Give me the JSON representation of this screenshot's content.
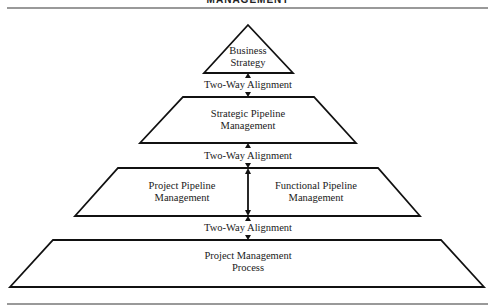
{
  "header": {
    "cut_off_title": "MANAGEMENT"
  },
  "levels": [
    {
      "id": "business-strategy",
      "line1": "Business",
      "line2": "Strategy"
    },
    {
      "id": "strategic-pipeline",
      "line1": "Strategic Pipeline",
      "line2": "Management"
    },
    {
      "id": "project-pipeline",
      "line1": "Project Pipeline",
      "line2": "Management"
    },
    {
      "id": "functional-pipeline",
      "line1": "Functional Pipeline",
      "line2": "Management"
    },
    {
      "id": "project-management-process",
      "line1": "Project Management",
      "line2": "Process"
    }
  ],
  "alignments": [
    {
      "label": "Two-Way Alignment"
    },
    {
      "label": "Two-Way Alignment"
    },
    {
      "label": "Two-Way Alignment"
    }
  ],
  "colors": {
    "stroke": "#111111",
    "rule": "#777777",
    "background": "#ffffff"
  }
}
